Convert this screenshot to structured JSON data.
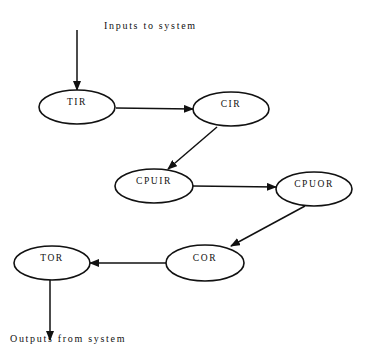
{
  "captions": {
    "inputs": "Inputs to system",
    "outputs": "Outputs from system"
  },
  "nodes": [
    {
      "id": "TIR",
      "label": "TIR",
      "cx": 77,
      "cy": 107,
      "rx": 38,
      "ry": 17
    },
    {
      "id": "CIR",
      "label": "CIR",
      "cx": 231,
      "cy": 109,
      "rx": 38,
      "ry": 17
    },
    {
      "id": "CPUIR",
      "label": "CPUIR",
      "cx": 154,
      "cy": 186,
      "rx": 39,
      "ry": 17
    },
    {
      "id": "CPUOR",
      "label": "CPUOR",
      "cx": 314,
      "cy": 189,
      "rx": 38,
      "ry": 17
    },
    {
      "id": "COR",
      "label": "COR",
      "cx": 205,
      "cy": 263,
      "rx": 39,
      "ry": 18
    },
    {
      "id": "TOR",
      "label": "TOR",
      "cx": 52,
      "cy": 263,
      "rx": 38,
      "ry": 17
    }
  ],
  "edges": [
    {
      "from": "input",
      "to": "TIR",
      "x1": 77,
      "y1": 30,
      "x2": 77,
      "y2": 90
    },
    {
      "from": "TIR",
      "to": "CIR",
      "x1": 116,
      "y1": 108,
      "x2": 193,
      "y2": 109
    },
    {
      "from": "CIR",
      "to": "CPUIR",
      "x1": 217,
      "y1": 127,
      "x2": 168,
      "y2": 169
    },
    {
      "from": "CPUIR",
      "to": "CPUOR",
      "x1": 193,
      "y1": 186,
      "x2": 276,
      "y2": 187
    },
    {
      "from": "CPUOR",
      "to": "COR",
      "x1": 305,
      "y1": 206,
      "x2": 231,
      "y2": 246
    },
    {
      "from": "COR",
      "to": "TOR",
      "x1": 166,
      "y1": 263,
      "x2": 90,
      "y2": 263
    },
    {
      "from": "TOR",
      "to": "output",
      "x1": 50,
      "y1": 280,
      "x2": 50,
      "y2": 340
    }
  ],
  "colors": {
    "stroke": "#111111",
    "background": "#ffffff"
  }
}
